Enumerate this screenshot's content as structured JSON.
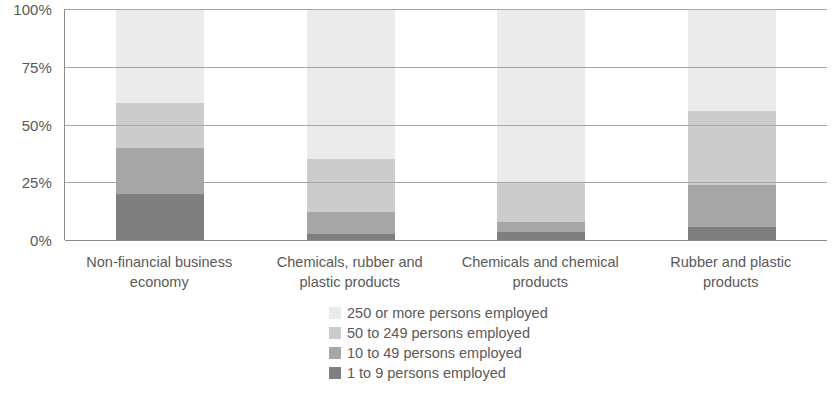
{
  "chart_data": {
    "type": "bar",
    "subtype": "stacked-percentage",
    "title": "",
    "subtitle": "",
    "xlabel": "",
    "ylabel": "",
    "ylim": [
      0,
      100
    ],
    "ytick_labels": [
      "100%",
      "75%",
      "50%",
      "25%",
      "0%"
    ],
    "ytick_values": [
      100,
      75,
      50,
      25,
      0
    ],
    "grid": true,
    "legend_position": "bottom-center",
    "categories": [
      "Non-financial business economy",
      "Chemicals, rubber and plastic products",
      "Chemicals and chemical products",
      "Rubber and plastic products"
    ],
    "series": [
      {
        "name": "1 to 9 persons employed",
        "color": "#7f7f7f",
        "values": [
          20.0,
          2.5,
          3.5,
          5.5
        ]
      },
      {
        "name": "10 to 49 persons employed",
        "color": "#a6a6a6",
        "values": [
          20.0,
          9.5,
          4.5,
          18.5
        ]
      },
      {
        "name": "50 to 249 persons employed",
        "color": "#cccccc",
        "values": [
          19.5,
          23.0,
          16.5,
          32.0
        ]
      },
      {
        "name": "250 or more persons employed",
        "color": "#ebebeb",
        "values": [
          40.5,
          65.0,
          75.5,
          44.0
        ]
      }
    ]
  },
  "axis": {
    "ticks": [
      {
        "label": "100%"
      },
      {
        "label": "75%"
      },
      {
        "label": "50%"
      },
      {
        "label": "25%"
      },
      {
        "label": "0%"
      }
    ]
  },
  "categories": [
    {
      "line1": "Non-financial business",
      "line2": "economy"
    },
    {
      "line1": "Chemicals, rubber and",
      "line2": "plastic products"
    },
    {
      "line1": "Chemicals and chemical",
      "line2": "products"
    },
    {
      "line1": "Rubber and plastic",
      "line2": "products"
    }
  ],
  "legend": {
    "items": [
      {
        "label": "250 or more persons employed",
        "color": "#ebebeb"
      },
      {
        "label": "50 to 249 persons employed",
        "color": "#cccccc"
      },
      {
        "label": "10 to 49 persons employed",
        "color": "#a6a6a6"
      },
      {
        "label": "1 to 9 persons employed",
        "color": "#7f7f7f"
      }
    ]
  },
  "colors": {
    "axis_line": "#8c8c8c",
    "gridline": "#a6a6a6",
    "text": "#595959",
    "background": "#ffffff"
  }
}
